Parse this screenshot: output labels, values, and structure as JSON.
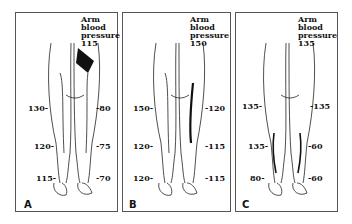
{
  "panels": [
    {
      "letter": "A",
      "arm_label": [
        "Arm",
        "blood",
        "pressure"
      ],
      "arm_value": "115",
      "left": [
        "130-",
        "120-",
        "115-"
      ],
      "right": [
        "-80",
        "-75",
        "-70"
      ]
    },
    {
      "letter": "B",
      "arm_label": [
        "Arm",
        "blood",
        "pressure"
      ],
      "arm_value": "150",
      "left": [
        "150-",
        "120-",
        "120-"
      ],
      "right": [
        "-120",
        "-115",
        "-115"
      ]
    },
    {
      "letter": "C",
      "arm_label": [
        "Arm",
        "blood",
        "pressure"
      ],
      "arm_value": "135",
      "left": [
        "135-",
        "135-",
        "80-"
      ],
      "right": [
        "-135",
        "-60",
        "-60"
      ]
    }
  ]
}
